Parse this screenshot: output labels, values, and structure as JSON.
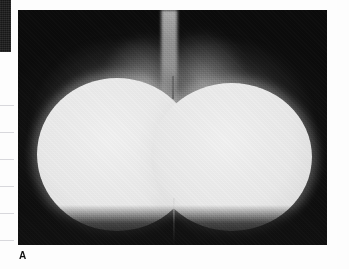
{
  "figure": {
    "panel_label": "A",
    "modality": "radiograph"
  },
  "panel": {
    "left": 18,
    "top": 10,
    "width": 309,
    "height": 235
  },
  "adjacent_block": {
    "name": "adjacent-figure-edge",
    "left": 0,
    "top": 0,
    "width": 11,
    "height": 52
  },
  "margin_rules": {
    "count": 6,
    "y_positions": [
      105,
      132,
      159,
      186,
      213,
      240
    ],
    "color": "#d8d8dc"
  },
  "colors": {
    "page_background": "#fdfdfd",
    "film_background": "#0d0d0d",
    "mass_highlight": "#f2f2f2",
    "mass_body": "#e6e6e6",
    "soft_tissue": "#8a8a8a",
    "dark_tissue": "#2a2a2a",
    "label_text": "#111111",
    "rule_line": "#d8d8dc"
  },
  "features": [
    {
      "name": "implant-left",
      "label": "left rounded mass"
    },
    {
      "name": "implant-right",
      "label": "right rounded mass"
    },
    {
      "name": "sternal-band",
      "label": "central vertical radiolucent band"
    },
    {
      "name": "midline-marker",
      "label": "thin vertical midline marker"
    },
    {
      "name": "notch",
      "label": "central cleft between masses"
    }
  ]
}
